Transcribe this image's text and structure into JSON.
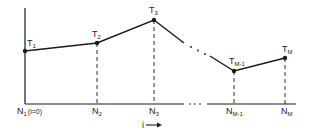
{
  "diagram": {
    "stroke_color": "#1a1a1a",
    "points": [
      {
        "id": "T1",
        "label": "T",
        "sub": "1",
        "node_label": "N",
        "node_sub": "1",
        "node_extra": "(i=0)",
        "x": 25,
        "y": 51
      },
      {
        "id": "T2",
        "label": "T",
        "sub": "2",
        "node_label": "N",
        "node_sub": "2",
        "node_extra": "",
        "x": 97,
        "y": 43
      },
      {
        "id": "T3",
        "label": "T",
        "sub": "3",
        "node_label": "N",
        "node_sub": "3",
        "node_extra": "",
        "x": 154,
        "y": 20
      },
      {
        "id": "TM-1",
        "label": "T",
        "sub": "M-1",
        "node_label": "N",
        "node_sub": "M-1",
        "node_extra": "",
        "x": 234,
        "y": 71
      },
      {
        "id": "TM",
        "label": "T",
        "sub": "M",
        "node_label": "N",
        "node_sub": "M",
        "node_extra": "",
        "x": 285,
        "y": 58
      }
    ],
    "axis_arrow_label": "i",
    "ellipsis": "..."
  }
}
